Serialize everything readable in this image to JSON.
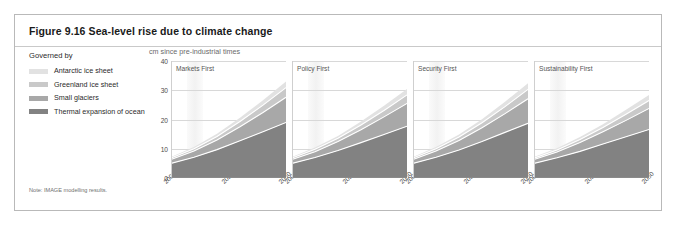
{
  "figure": {
    "title": "Figure 9.16 Sea-level rise due to climate change",
    "note": "Note: IMAGE modelling results."
  },
  "legend": {
    "heading": "Governed by",
    "items": [
      {
        "label": "Antarctic ice sheet",
        "color": "#e2e2e2"
      },
      {
        "label": "Greenland ice sheet",
        "color": "#c9c9c9"
      },
      {
        "label": "Small glaciers",
        "color": "#a8a8a8"
      },
      {
        "label": "Thermal expansion of ocean",
        "color": "#828282"
      }
    ]
  },
  "chart_data": {
    "type": "area",
    "title": "Figure 9.16 Sea-level rise due to climate change",
    "ylabel": "cm since pre-industrial times",
    "xlabel": "",
    "ylim": [
      0,
      40
    ],
    "yticks": [
      0,
      10,
      20,
      30,
      40
    ],
    "xlim": [
      2000,
      2050
    ],
    "xticks": [
      2000,
      2025,
      2050
    ],
    "xtick_labels": [
      "2000",
      "2025",
      "2050"
    ],
    "grid": true,
    "legend_position": "left",
    "stacked": true,
    "series_order": [
      "Thermal expansion of ocean",
      "Small glaciers",
      "Greenland ice sheet",
      "Antarctic ice sheet"
    ],
    "x": [
      2000,
      2010,
      2020,
      2030,
      2040,
      2050
    ],
    "panels": [
      {
        "title": "Markets First",
        "series": [
          {
            "name": "Thermal expansion of ocean",
            "color": "#828282",
            "values": [
              5.0,
              7.1,
              9.7,
              12.7,
              15.8,
              19.0
            ]
          },
          {
            "name": "Small glaciers",
            "color": "#a8a8a8",
            "values": [
              1.3,
              2.1,
              3.3,
              4.8,
              6.6,
              8.6
            ]
          },
          {
            "name": "Greenland ice sheet",
            "color": "#c9c9c9",
            "values": [
              0.5,
              0.8,
              1.2,
              1.8,
              2.5,
              3.3
            ]
          },
          {
            "name": "Antarctic ice sheet",
            "color": "#e2e2e2",
            "values": [
              0.4,
              0.6,
              0.9,
              1.3,
              1.7,
              2.1
            ]
          }
        ],
        "total": [
          7.2,
          10.6,
          15.1,
          20.6,
          26.6,
          33.0
        ]
      },
      {
        "title": "Policy First",
        "series": [
          {
            "name": "Thermal expansion of ocean",
            "color": "#828282",
            "values": [
              5.0,
              7.0,
              9.4,
              12.1,
              14.9,
              17.7
            ]
          },
          {
            "name": "Small glaciers",
            "color": "#a8a8a8",
            "values": [
              1.3,
              2.0,
              3.1,
              4.4,
              6.0,
              7.8
            ]
          },
          {
            "name": "Greenland ice sheet",
            "color": "#c9c9c9",
            "values": [
              0.5,
              0.8,
              1.1,
              1.6,
              2.2,
              2.9
            ]
          },
          {
            "name": "Antarctic ice sheet",
            "color": "#e2e2e2",
            "values": [
              0.4,
              0.6,
              0.8,
              1.2,
              1.6,
              2.0
            ]
          }
        ],
        "total": [
          7.2,
          10.4,
          14.4,
          19.3,
          24.7,
          30.4
        ]
      },
      {
        "title": "Security First",
        "series": [
          {
            "name": "Thermal expansion of ocean",
            "color": "#828282",
            "values": [
              5.0,
              7.1,
              9.6,
              12.5,
              15.6,
              18.7
            ]
          },
          {
            "name": "Small glaciers",
            "color": "#a8a8a8",
            "values": [
              1.3,
              2.1,
              3.2,
              4.7,
              6.4,
              8.4
            ]
          },
          {
            "name": "Greenland ice sheet",
            "color": "#c9c9c9",
            "values": [
              0.5,
              0.8,
              1.2,
              1.7,
              2.4,
              3.2
            ]
          },
          {
            "name": "Antarctic ice sheet",
            "color": "#e2e2e2",
            "values": [
              0.4,
              0.6,
              0.9,
              1.2,
              1.7,
              2.1
            ]
          }
        ],
        "total": [
          7.2,
          10.6,
          14.9,
          20.1,
          26.1,
          32.4
        ]
      },
      {
        "title": "Sustainability First",
        "series": [
          {
            "name": "Thermal expansion of ocean",
            "color": "#828282",
            "values": [
              5.0,
              6.9,
              9.1,
              11.6,
              14.1,
              16.6
            ]
          },
          {
            "name": "Small glaciers",
            "color": "#a8a8a8",
            "values": [
              1.3,
              2.0,
              3.0,
              4.2,
              5.6,
              7.2
            ]
          },
          {
            "name": "Greenland ice sheet",
            "color": "#c9c9c9",
            "values": [
              0.5,
              0.7,
              1.1,
              1.5,
              2.1,
              2.7
            ]
          },
          {
            "name": "Antarctic ice sheet",
            "color": "#e2e2e2",
            "values": [
              0.4,
              0.6,
              0.8,
              1.1,
              1.5,
              1.9
            ]
          }
        ],
        "total": [
          7.2,
          10.2,
          14.0,
          18.4,
          23.3,
          28.4
        ]
      }
    ]
  }
}
